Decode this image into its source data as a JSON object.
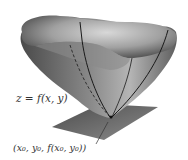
{
  "diagram": {
    "surface_label": "z = f(x, y)",
    "point_label": "(x₀, y₀, f(x₀, y₀))",
    "colors": {
      "surface_dark": "#555555",
      "surface_light": "#c8c8c8",
      "plane": "#6a6a6a",
      "curve": "#1a1a1a",
      "text": "#333333"
    }
  }
}
